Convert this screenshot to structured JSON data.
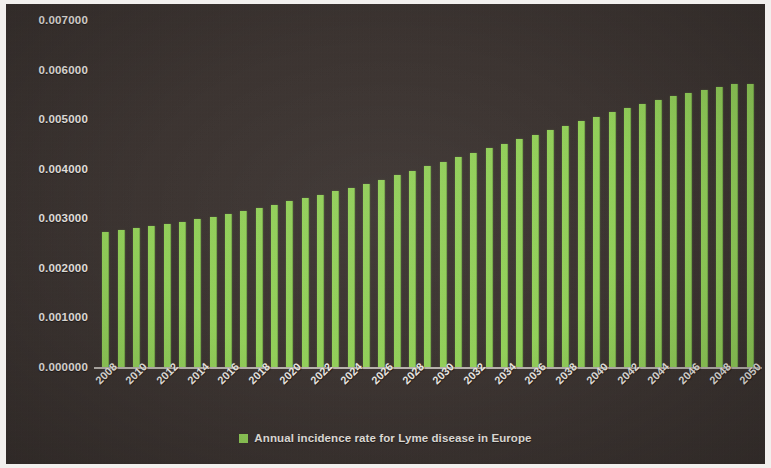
{
  "chart_data": {
    "type": "bar",
    "title": "",
    "xlabel": "",
    "ylabel": "",
    "ylim": [
      0.0,
      0.007
    ],
    "grid": false,
    "legend_position": "bottom",
    "y_tick_labels": [
      "0.007000",
      "0.006000",
      "0.005000",
      "0.004000",
      "0.003000",
      "0.002000",
      "0.001000",
      "0.000000"
    ],
    "y_tick_values": [
      0.007,
      0.006,
      0.005,
      0.004,
      0.003,
      0.002,
      0.001,
      0.0
    ],
    "x_tick_labels": [
      "2008",
      "2010",
      "2012",
      "2014",
      "2016",
      "2018",
      "2020",
      "2022",
      "2024",
      "2026",
      "2028",
      "2030",
      "2032",
      "2034",
      "2036",
      "2038",
      "2040",
      "2042",
      "2044",
      "2046",
      "2048",
      "2050"
    ],
    "x_tick_step": 2,
    "categories": [
      "2008",
      "2009",
      "2010",
      "2011",
      "2012",
      "2013",
      "2014",
      "2015",
      "2016",
      "2017",
      "2018",
      "2019",
      "2020",
      "2021",
      "2022",
      "2023",
      "2024",
      "2025",
      "2026",
      "2027",
      "2028",
      "2029",
      "2030",
      "2031",
      "2032",
      "2033",
      "2034",
      "2035",
      "2036",
      "2037",
      "2038",
      "2039",
      "2040",
      "2041",
      "2042",
      "2043",
      "2044",
      "2045",
      "2046",
      "2047",
      "2048",
      "2049",
      "2050"
    ],
    "series": [
      {
        "name": "Annual incidence rate for Lyme disease in Europe",
        "color": "#93d159",
        "values": [
          0.00273,
          0.00277,
          0.00281,
          0.00285,
          0.00289,
          0.00293,
          0.00298,
          0.00303,
          0.00309,
          0.00315,
          0.00321,
          0.00327,
          0.00334,
          0.00341,
          0.00348,
          0.00355,
          0.00362,
          0.0037,
          0.00378,
          0.00387,
          0.00396,
          0.00405,
          0.00414,
          0.00423,
          0.00432,
          0.00441,
          0.0045,
          0.0046,
          0.00469,
          0.00478,
          0.00487,
          0.00496,
          0.00505,
          0.00514,
          0.00523,
          0.00531,
          0.00539,
          0.00546,
          0.00553,
          0.00559,
          0.00565,
          0.0057,
          0.00571
        ]
      }
    ],
    "legend": [
      {
        "label": "Annual incidence rate for Lyme disease in Europe",
        "color": "#93d159"
      }
    ],
    "colors": {
      "background": "#3b3330",
      "bar": "#93d159",
      "text": "#efebe6",
      "axis_line": "#cfcac4"
    }
  }
}
